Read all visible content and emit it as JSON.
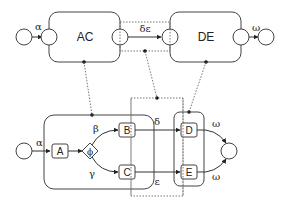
{
  "top": {
    "boxes": [
      {
        "id": "AC",
        "label": "AC"
      },
      {
        "id": "DE",
        "label": "DE"
      }
    ],
    "edges": {
      "input": "α",
      "middle": "δε",
      "output": "ω"
    }
  },
  "bottom": {
    "nodes": [
      {
        "id": "A",
        "label": "A"
      },
      {
        "id": "B",
        "label": "B"
      },
      {
        "id": "C",
        "label": "C"
      },
      {
        "id": "D",
        "label": "D"
      },
      {
        "id": "E",
        "label": "E"
      }
    ],
    "gateway": {
      "label": "ϕ"
    },
    "edges": {
      "input": "α",
      "beta": "β",
      "gamma": "γ",
      "delta": "δ",
      "epsilon": "ε",
      "omega_top": "ω",
      "omega_bottom": "ω"
    }
  }
}
